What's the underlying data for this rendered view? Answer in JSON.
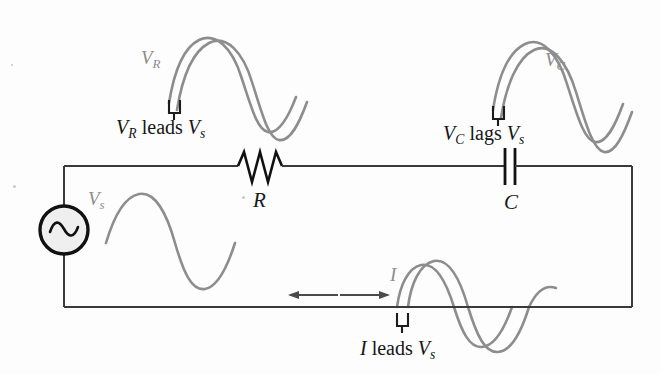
{
  "figure": {
    "background_color": "#fdfdfd",
    "wave_color": "#8d8d8d",
    "wire_color": "#3a3a3a",
    "text_color": "#161616"
  },
  "circuit": {
    "source": {
      "name": "ac-voltage-source",
      "symbol": "sine-in-circle",
      "label": "V",
      "label_sub": "s"
    },
    "resistor": {
      "name": "resistor",
      "symbol": "zigzag",
      "label": "R"
    },
    "capacitor": {
      "name": "capacitor",
      "symbol": "parallel-plates",
      "label": "C"
    },
    "current_arrows": {
      "name": "current-direction-arrows",
      "left_arrow": "←",
      "right_arrow": "→"
    }
  },
  "waveforms": [
    {
      "id": "vr",
      "name": "resistor-voltage-waveform",
      "label": "V",
      "label_sub": "R",
      "curves": 2,
      "caption_main": "V",
      "caption_sub": "R",
      "caption_verb": " leads ",
      "caption_ref": "V",
      "caption_ref_sub": "s",
      "caption_text": "V_R leads V_s",
      "phase_relation": "leads"
    },
    {
      "id": "vc",
      "name": "capacitor-voltage-waveform",
      "label": "V",
      "label_sub": "C",
      "curves": 2,
      "caption_main": "V",
      "caption_sub": "C",
      "caption_verb": " lags ",
      "caption_ref": "V",
      "caption_ref_sub": "s",
      "caption_text": "V_C lags V_s",
      "phase_relation": "lags"
    },
    {
      "id": "vs",
      "name": "source-voltage-waveform",
      "label": "V",
      "label_sub": "s",
      "curves": 1,
      "caption_text": "",
      "phase_relation": "reference"
    },
    {
      "id": "i",
      "name": "current-waveform",
      "label": "I",
      "label_sub": "",
      "curves": 2,
      "caption_main": "I",
      "caption_sub": "",
      "caption_verb": " leads ",
      "caption_ref": "V",
      "caption_ref_sub": "s",
      "caption_text": "I leads V_s",
      "phase_relation": "leads"
    }
  ],
  "markers": {
    "phase_bracket_name": "phase-shift-bracket",
    "count": 3
  }
}
